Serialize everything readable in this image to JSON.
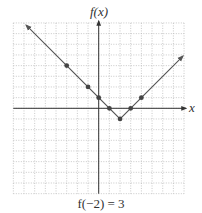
{
  "chart_data": {
    "type": "line",
    "title": "",
    "xlabel": "x",
    "ylabel": "f(x)",
    "xlim": [
      -8,
      8
    ],
    "ylim": [
      -8,
      8
    ],
    "grid": true,
    "function": "f(x) = |x - 2| - 1",
    "line_endpoints": [
      [
        -6.8,
        7.8
      ],
      [
        7.9,
        4.9
      ]
    ],
    "series": [
      {
        "name": "f(x)",
        "points": [
          {
            "x": -3,
            "y": 4
          },
          {
            "x": -1,
            "y": 2
          },
          {
            "x": 0,
            "y": 1
          },
          {
            "x": 1,
            "y": 0
          },
          {
            "x": 2,
            "y": -1
          },
          {
            "x": 3,
            "y": 0
          },
          {
            "x": 4,
            "y": 1
          }
        ]
      }
    ],
    "annotation": "f(−2) = 3"
  },
  "labels": {
    "y_axis": "f(x)",
    "x_axis": "x",
    "caption": "f(−2) = 3"
  },
  "colors": {
    "grid": "#bbbbbb",
    "axis": "#333333",
    "line": "#555555",
    "point": "#444444"
  }
}
